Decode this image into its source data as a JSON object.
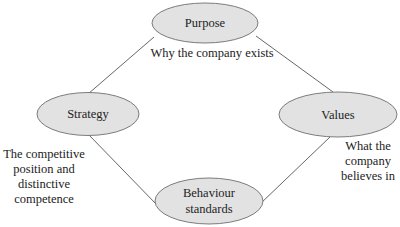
{
  "diagram": {
    "type": "four-node cycle",
    "colors": {
      "node_fill": "#e2e2e2",
      "node_stroke": "#6e6e6e",
      "connector": "#555555",
      "text": "#222222"
    },
    "nodes": {
      "purpose": {
        "label_lines": [
          "Purpose"
        ],
        "caption_lines": [
          "Why the company exists"
        ]
      },
      "strategy": {
        "label_lines": [
          "Strategy"
        ],
        "caption_lines": [
          "The competitive",
          "position and",
          "distinctive",
          "competence"
        ]
      },
      "values": {
        "label_lines": [
          "Values"
        ],
        "caption_lines": [
          "What the",
          "company",
          "believes in"
        ]
      },
      "behaviour": {
        "label_lines": [
          "Behaviour",
          "standards"
        ],
        "caption_lines": []
      }
    },
    "edges": [
      {
        "from": "strategy",
        "to": "purpose"
      },
      {
        "from": "purpose",
        "to": "values"
      },
      {
        "from": "values",
        "to": "behaviour"
      },
      {
        "from": "behaviour",
        "to": "strategy"
      }
    ]
  }
}
